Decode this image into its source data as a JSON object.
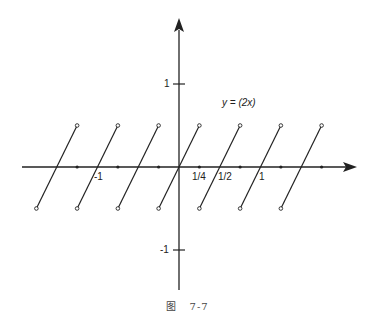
{
  "chart_data": {
    "type": "line",
    "title": "",
    "function_label": "y = (2x)",
    "xlabel": "",
    "ylabel": "",
    "x_tick_labels": [
      "-1",
      "1/4",
      "1/2",
      "1"
    ],
    "y_tick_labels": [
      "1",
      "-1"
    ],
    "xlim": [
      -1.5,
      1.75
    ],
    "ylim": [
      -1.5,
      1.5
    ],
    "grid": false,
    "legend": null,
    "x_axis_dots": [
      -1.25,
      -0.75,
      -0.25,
      0.25,
      0.75,
      1.25,
      1.75
    ],
    "zero_crossings": [
      -1.5,
      -1.0,
      -0.5,
      0.0,
      0.5,
      1.0,
      1.5
    ],
    "series": [
      {
        "name": "segment",
        "x": [
          -1.75,
          -1.25
        ],
        "y": [
          -0.5,
          0.5
        ],
        "endpoints": "open"
      },
      {
        "name": "segment",
        "x": [
          -1.25,
          -0.75
        ],
        "y": [
          -0.5,
          0.5
        ],
        "endpoints": "open"
      },
      {
        "name": "segment",
        "x": [
          -0.75,
          -0.25
        ],
        "y": [
          -0.5,
          0.5
        ],
        "endpoints": "open"
      },
      {
        "name": "segment",
        "x": [
          -0.25,
          0.25
        ],
        "y": [
          -0.5,
          0.5
        ],
        "endpoints": "open"
      },
      {
        "name": "segment",
        "x": [
          0.25,
          0.75
        ],
        "y": [
          -0.5,
          0.5
        ],
        "endpoints": "open"
      },
      {
        "name": "segment",
        "x": [
          0.75,
          1.25
        ],
        "y": [
          -0.5,
          0.5
        ],
        "endpoints": "open"
      },
      {
        "name": "segment",
        "x": [
          1.25,
          1.75
        ],
        "y": [
          -0.5,
          0.5
        ],
        "endpoints": "open"
      }
    ]
  },
  "labels": {
    "function": "y = (2x)",
    "x_neg1": "-1",
    "x_quarter": "1/4",
    "x_half": "1/2",
    "x_one": "1",
    "y_one": "1",
    "y_neg1": "-1"
  },
  "caption": {
    "prefix": "图",
    "number": "7-7"
  }
}
